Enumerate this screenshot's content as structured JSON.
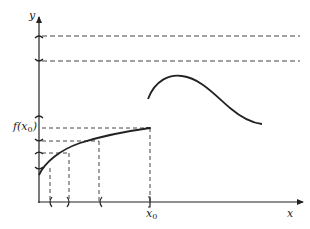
{
  "diagram": {
    "type": "function-continuity-illustration",
    "axes": {
      "x_label": "x",
      "y_label": "y"
    },
    "labels": {
      "f_x0": "f(x",
      "f_x0_sub": "0",
      "f_x0_close": ")",
      "x0": "x",
      "x0_sub": "0"
    },
    "stroke_color": "#222222",
    "background": "#ffffff",
    "elements": {
      "left_curve": "increasing concave curve ending at (x0, f(x0))",
      "right_curve": "hump-shaped curve beginning above, starting just right of x0 (jump discontinuity)",
      "upper_bands": "two dashed horizontal lines with y-axis brackets",
      "lower_bands": "dashed horizontal guides at f(x0) and nested y-intervals",
      "x_intervals": "parenthesis brackets on x-axis with dashed verticals"
    }
  }
}
